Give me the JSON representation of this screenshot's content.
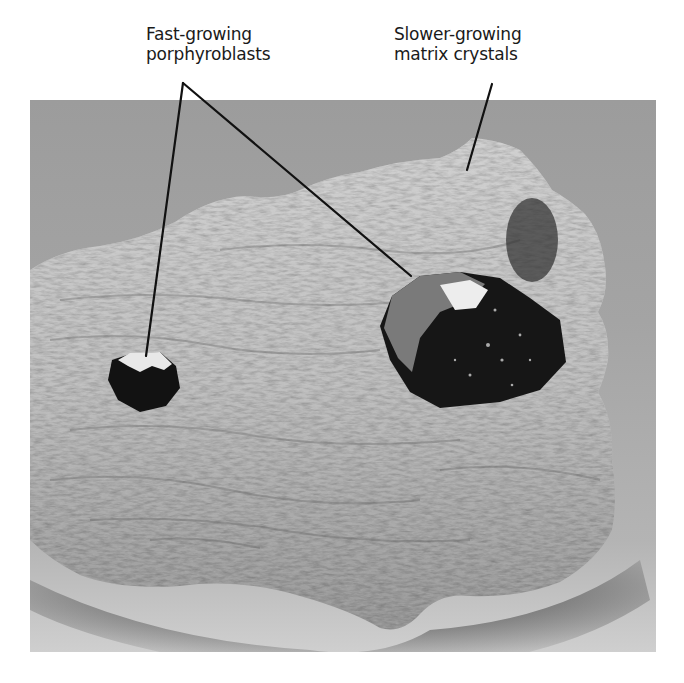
{
  "figure": {
    "labels": [
      {
        "id": "fast",
        "lines": [
          "Fast-growing",
          "porphyroblasts"
        ],
        "points_to": [
          "small-crystal",
          "large-crystal"
        ]
      },
      {
        "id": "slow",
        "lines": [
          "Slower-growing",
          "matrix crystals"
        ],
        "points_to": [
          "rock-matrix"
        ]
      }
    ],
    "colors": {
      "label_text": "#1a1a1a",
      "leader_line": "#111111",
      "background_backdrop": "#a0a0a0",
      "rock_light": "#c8c8c8",
      "rock_dark": "#6e6e6e",
      "crystal": "#141414"
    }
  }
}
